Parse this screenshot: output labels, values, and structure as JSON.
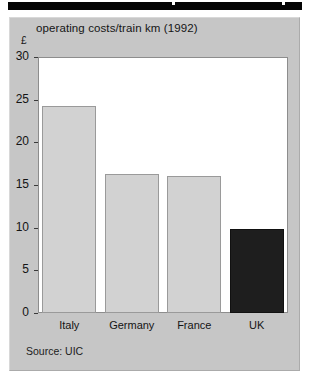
{
  "figure": {
    "unit_label": "£",
    "source_note": "Source: UIC",
    "background_color": "#c6c6c6",
    "plot_background_color": "#ffffff",
    "bar_color": "#d2d2d2",
    "highlight_bar_color": "#1e1e1e",
    "top_rule_color": "#050505"
  },
  "chart_data": {
    "type": "bar",
    "title": "operating costs/train km (1992)",
    "xlabel": "",
    "ylabel": "£",
    "categories": [
      "Italy",
      "Germany",
      "France",
      "UK"
    ],
    "values": [
      24.2,
      16.3,
      16.0,
      9.8
    ],
    "bar_colors": [
      "#d2d2d2",
      "#d2d2d2",
      "#d2d2d2",
      "#1e1e1e"
    ],
    "highlighted_category": "UK",
    "ylim": [
      0,
      30
    ],
    "yticks": [
      0,
      5,
      10,
      15,
      20,
      25,
      30
    ],
    "ytick_labels": [
      "0",
      "5",
      "10",
      "15",
      "20",
      "25",
      "30"
    ],
    "grid": false,
    "legend": null,
    "annotations": [
      "Source: UIC"
    ]
  }
}
